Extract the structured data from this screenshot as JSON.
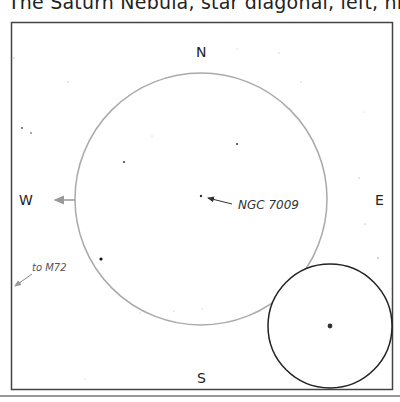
{
  "caption": "The Saturn Nebula, star diagonal, left, high power",
  "compass": {
    "north": "N",
    "south": "S",
    "east": "E",
    "west": "W"
  },
  "target": {
    "label": "NGC 7009"
  },
  "pointer": {
    "label": "to M72"
  },
  "colors": {
    "frame": "#333333",
    "finder_circle": "#aaaaaa",
    "inset_circle": "#222222",
    "arrow": "#999999",
    "rule": "#999999"
  }
}
